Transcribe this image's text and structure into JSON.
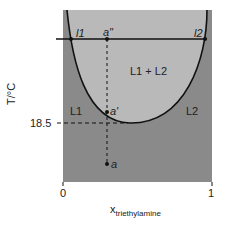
{
  "diagram": {
    "type": "liquid-liquid phase diagram",
    "y_axis_label": "T/°C",
    "x_axis_label_main": "x",
    "x_axis_label_sub": "triethylamine",
    "x_ticks": [
      "0",
      "1"
    ],
    "y_tick": "18.5",
    "regions": {
      "two_phase": "L1 + L2",
      "left_single": "L1",
      "right_single": "L2"
    },
    "points": {
      "a": "a",
      "a_prime": "a'",
      "a_double_prime": "a\""
    },
    "tie_line_ends": {
      "left": "l1",
      "right": "l2"
    },
    "colors": {
      "single_phase": "#8a8a8a",
      "two_phase": "#b9b9b9",
      "lines": "#111111"
    }
  }
}
